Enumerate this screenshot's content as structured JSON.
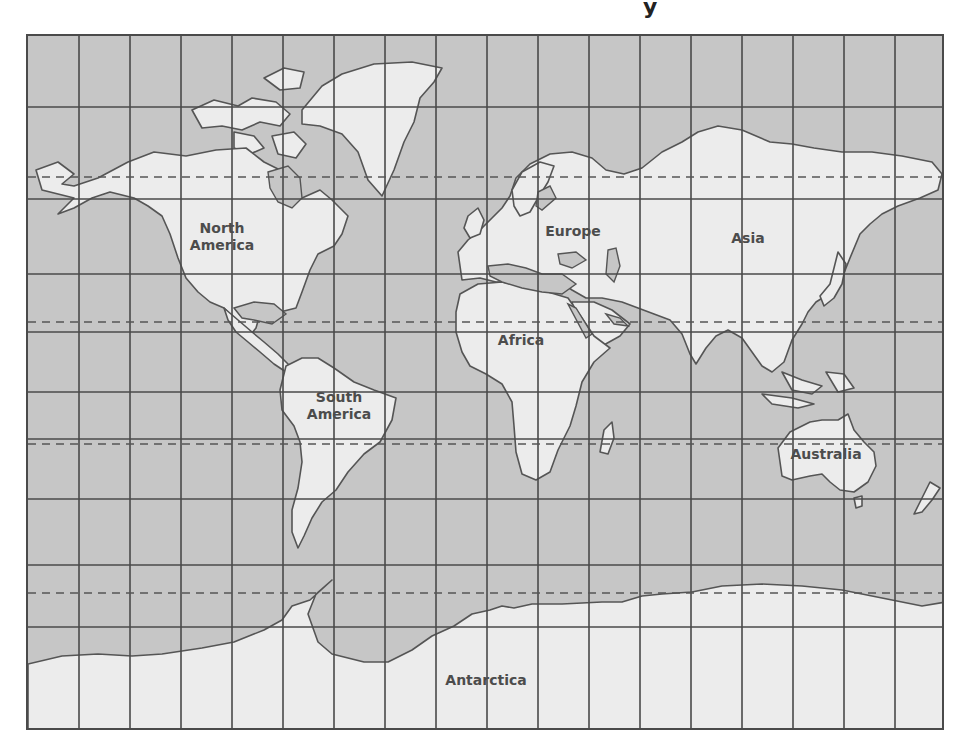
{
  "title_fragment": "y",
  "map": {
    "type": "world-map-mercator-grid",
    "colors": {
      "ocean": "#c6c6c6",
      "land": "#ececec",
      "inland_water": "#c6c6c6",
      "outline": "#555555",
      "grid": "#4a4a4a",
      "label": "#4c4c4c"
    },
    "grid": {
      "columns": 18,
      "horizontal_lines_y": [
        105,
        197,
        272,
        330,
        390,
        437,
        497,
        563,
        625
      ],
      "dashed_lines": [
        {
          "name": "arctic-circle",
          "y": 175
        },
        {
          "name": "tropic-of-cancer",
          "y": 320
        },
        {
          "name": "tropic-of-capricorn",
          "y": 442
        },
        {
          "name": "antarctic-circle",
          "y": 591
        }
      ]
    },
    "labels": [
      {
        "id": "north-america",
        "text": "North\nAmerica",
        "x": 222,
        "y": 237
      },
      {
        "id": "europe",
        "text": "Europe",
        "x": 573,
        "y": 231
      },
      {
        "id": "asia",
        "text": "Asia",
        "x": 748,
        "y": 238
      },
      {
        "id": "africa",
        "text": "Africa",
        "x": 521,
        "y": 340
      },
      {
        "id": "south-america",
        "text": "South\nAmerica",
        "x": 339,
        "y": 406
      },
      {
        "id": "australia",
        "text": "Australia",
        "x": 826,
        "y": 454
      },
      {
        "id": "antarctica",
        "text": "Antarctica",
        "x": 486,
        "y": 680
      }
    ]
  }
}
